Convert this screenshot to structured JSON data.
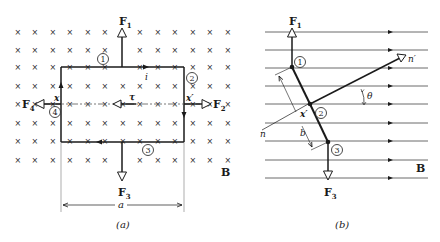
{
  "panel_a": {
    "caption": "(a)",
    "forces": {
      "f1": {
        "main": "F",
        "sub": "1"
      },
      "f2": {
        "main": "F",
        "sub": "2"
      },
      "f3": {
        "main": "F",
        "sub": "3"
      },
      "f4": {
        "main": "F",
        "sub": "4"
      }
    },
    "side_labels": {
      "s1": "1",
      "s2": "2",
      "s3": "3",
      "s4": "4"
    },
    "current_label": "i",
    "torque_label": "τ",
    "axis_x": "x",
    "axis_x_prime": "x′",
    "dimension_label": "a",
    "field_label": "B"
  },
  "panel_b": {
    "caption": "(b)",
    "forces": {
      "f1": {
        "main": "F",
        "sub": "1"
      },
      "f3": {
        "main": "F",
        "sub": "3"
      }
    },
    "side_labels": {
      "s1": "1",
      "s2": "2",
      "s3": "3"
    },
    "normal_label": "n",
    "normal_prime_label": "n′",
    "angle_label": "θ",
    "axis_x_prime": "x′",
    "dimension_label": "b",
    "field_label": "B"
  },
  "colors": {
    "ink": "#1a1a1a",
    "dash": "#555555",
    "background": "#ffffff"
  }
}
